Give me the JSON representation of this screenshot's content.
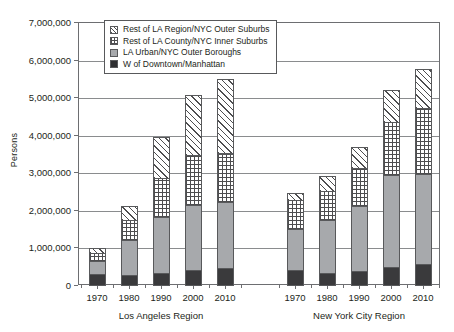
{
  "chart_data": {
    "type": "bar",
    "title": "",
    "subtitle": "",
    "xlabel": "",
    "ylabel": "Persons",
    "ylim": [
      0,
      7000000
    ],
    "ytick_step": 1000000,
    "ytick_labels": [
      "7,000,000",
      "6,000,000",
      "5,000,000",
      "4,000,000",
      "3,000,000",
      "2,000,000",
      "1,000,000",
      "0"
    ],
    "ytick_values": [
      7000000,
      6000000,
      5000000,
      4000000,
      3000000,
      2000000,
      1000000,
      0
    ],
    "grid": true,
    "stacked": true,
    "legend_position": "top-left-inside",
    "groups": [
      {
        "name": "Los Angeles Region",
        "categories": [
          "1970",
          "1980",
          "1990",
          "2000",
          "2010"
        ]
      },
      {
        "name": "New York City Region",
        "categories": [
          "1970",
          "1980",
          "1990",
          "2000",
          "2010"
        ]
      }
    ],
    "categories": [
      "1970",
      "1980",
      "1990",
      "2000",
      "2010",
      "1970",
      "1980",
      "1990",
      "2000",
      "2010"
    ],
    "series": [
      {
        "name": "W of Downtown/Manhattan",
        "fill": "solid-black",
        "color": "#3a3a3c",
        "values": [
          300000,
          260000,
          320000,
          390000,
          450000,
          400000,
          330000,
          360000,
          490000,
          550000
        ]
      },
      {
        "name": "LA Urban/NYC Outer Boroughs",
        "fill": "solid-gray",
        "color": "#a7a9ac",
        "values": [
          350000,
          930000,
          1480000,
          1750000,
          1750000,
          1100000,
          1400000,
          1750000,
          2430000,
          2400000
        ]
      },
      {
        "name": "Rest of LA County/NYC Inner Suburbs",
        "fill": "cross-hatch",
        "color": "#ffffff",
        "values": [
          200000,
          530000,
          1050000,
          1310000,
          1300000,
          750000,
          780000,
          1010000,
          1430000,
          1750000
        ]
      },
      {
        "name": "Rest of LA Region/NYC Outer Suburbs",
        "fill": "diagonal-hatch",
        "color": "#ffffff",
        "values": [
          130000,
          370000,
          1100000,
          1620000,
          1980000,
          200000,
          380000,
          540000,
          850000,
          1050000
        ]
      }
    ],
    "totals": [
      980000,
      2090000,
      3950000,
      5070000,
      5480000,
      2450000,
      2890000,
      3660000,
      5200000,
      5750000
    ],
    "legend_entries": [
      "Rest of LA Region/NYC Outer Suburbs",
      "Rest of LA County/NYC Inner Suburbs",
      "LA Urban/NYC Outer Boroughs",
      "W of Downtown/Manhattan"
    ]
  }
}
